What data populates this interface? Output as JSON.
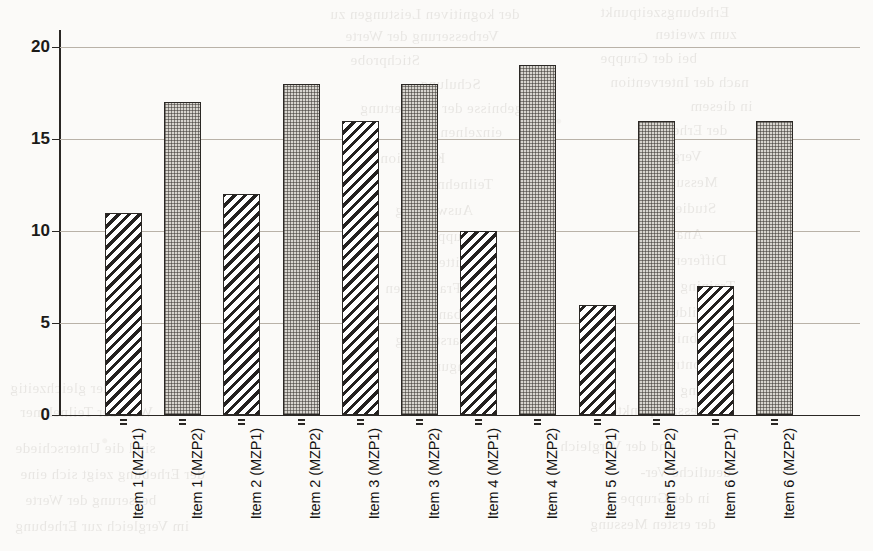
{
  "figure": {
    "kind": "scanned-bar-chart-figure",
    "page_background": "#fbfaf8",
    "ink_color": "#1c1a18",
    "gridline_color": "#b9b2a8"
  },
  "chart_data": {
    "type": "bar",
    "title": "",
    "subtitle": "",
    "xlabel": "",
    "ylabel": "",
    "categories": [
      "Item 1 (MZP1)",
      "Item 1 (MZP2)",
      "Item 2 (MZP1)",
      "Item 2 (MZP2)",
      "Item 3 (MZP1)",
      "Item 3 (MZP2)",
      "Item 4 (MZP1)",
      "Item 4 (MZP2)",
      "Item 5 (MZP1)",
      "Item 5 (MZP2)",
      "Item 6 (MZP1)",
      "Item 6 (MZP2)"
    ],
    "values": [
      11,
      17,
      12,
      18,
      16,
      18,
      10,
      19,
      6,
      16,
      7,
      16
    ],
    "fill_patterns": [
      "diagonal-hatch",
      "stipple",
      "diagonal-hatch",
      "stipple",
      "diagonal-hatch",
      "stipple",
      "diagonal-hatch",
      "stipple",
      "diagonal-hatch",
      "stipple",
      "diagonal-hatch",
      "stipple"
    ],
    "ylim": [
      0,
      20
    ],
    "ytick_values": [
      0,
      5,
      10,
      15,
      20
    ],
    "ytick_labels": [
      "0",
      "5",
      "10",
      "15",
      "20"
    ],
    "grid": true,
    "grid_axis": "y",
    "legend": null,
    "legend_position": "none",
    "annotations": [],
    "series_groups": [
      {
        "name": "MZP1",
        "pattern": "diagonal-hatch",
        "values": [
          11,
          12,
          16,
          10,
          6,
          7
        ]
      },
      {
        "name": "MZP2",
        "pattern": "stipple",
        "values": [
          17,
          18,
          18,
          19,
          16,
          16
        ]
      }
    ],
    "group_categories": [
      "Item 1",
      "Item 2",
      "Item 3",
      "Item 4",
      "Item 5",
      "Item 6"
    ]
  },
  "scan_bleed": {
    "note": "faint mirrored show-through text from reverse side of the scanned page",
    "lines": [
      {
        "text": "der kognitiven Leistungen zu",
        "x": 330,
        "y": 6,
        "size": 15
      },
      {
        "text": "Erhebungszeitpunkt",
        "x": 600,
        "y": 4,
        "size": 15
      },
      {
        "text": "Verbesserung der Werte",
        "x": 345,
        "y": 28,
        "size": 15
      },
      {
        "text": "zum zweiten",
        "x": 655,
        "y": 26,
        "size": 15
      },
      {
        "text": "Stichprobe",
        "x": 350,
        "y": 52,
        "size": 15
      },
      {
        "text": "bei der Gruppe",
        "x": 600,
        "y": 50,
        "size": 15
      },
      {
        "text": "Schulung",
        "x": 420,
        "y": 76,
        "size": 15
      },
      {
        "text": "nach der Intervention",
        "x": 610,
        "y": 74,
        "size": 15
      },
      {
        "text": "Ergebnisse der Auswertung",
        "x": 360,
        "y": 100,
        "size": 15
      },
      {
        "text": "in diesem",
        "x": 690,
        "y": 98,
        "size": 15
      },
      {
        "text": "einzelnen Items",
        "x": 400,
        "y": 124,
        "size": 15
      },
      {
        "text": "der Erhebung",
        "x": 640,
        "y": 122,
        "size": 15
      },
      {
        "text": "Kognition",
        "x": 380,
        "y": 150,
        "size": 15
      },
      {
        "text": "Vergleich",
        "x": 640,
        "y": 148,
        "size": 15
      },
      {
        "text": "Teilnehmer",
        "x": 420,
        "y": 176,
        "size": 15
      },
      {
        "text": "Messung",
        "x": 660,
        "y": 174,
        "size": 15
      },
      {
        "text": "Auswertung",
        "x": 395,
        "y": 202,
        "size": 15
      },
      {
        "text": "Studie",
        "x": 675,
        "y": 200,
        "size": 15
      },
      {
        "text": "Gruppe",
        "x": 430,
        "y": 228,
        "size": 15
      },
      {
        "text": "Analyse",
        "x": 650,
        "y": 226,
        "size": 15
      },
      {
        "text": "Mittelwert",
        "x": 405,
        "y": 254,
        "size": 15
      },
      {
        "text": "Differenz",
        "x": 665,
        "y": 252,
        "size": 15
      },
      {
        "text": "Fragebogen",
        "x": 385,
        "y": 280,
        "size": 15
      },
      {
        "text": "Training",
        "x": 680,
        "y": 278,
        "size": 15
      },
      {
        "text": "Probanden",
        "x": 415,
        "y": 306,
        "size": 15
      },
      {
        "text": "Abbildung",
        "x": 655,
        "y": 304,
        "size": 15
      },
      {
        "text": "Darstellung",
        "x": 395,
        "y": 332,
        "size": 15
      },
      {
        "text": "Ergebnis",
        "x": 670,
        "y": 330,
        "size": 15
      },
      {
        "text": "Befragung",
        "x": 425,
        "y": 358,
        "size": 15
      },
      {
        "text": "Kontrolle",
        "x": 650,
        "y": 356,
        "size": 15
      },
      {
        "text": "und der gleichzeitig",
        "x": 10,
        "y": 380,
        "size": 15
      },
      {
        "text": "Leistung",
        "x": 680,
        "y": 382,
        "size": 15
      },
      {
        "text": "Wert der Teilnehmer",
        "x": 20,
        "y": 404,
        "size": 15
      },
      {
        "text": "Messzeitpunkte",
        "x": 610,
        "y": 402,
        "size": 15
      },
      {
        "text": "sind die Unterschiede",
        "x": 15,
        "y": 440,
        "size": 15
      },
      {
        "text": "und der Vergleich",
        "x": 560,
        "y": 438,
        "size": 15
      },
      {
        "text": "der Erhebung zeigt sich eine",
        "x": 20,
        "y": 466,
        "size": 15
      },
      {
        "text": "deutliche Ver-",
        "x": 640,
        "y": 464,
        "size": 15
      },
      {
        "text": "besserung der Werte",
        "x": 25,
        "y": 492,
        "size": 15
      },
      {
        "text": "in der Gruppe",
        "x": 620,
        "y": 490,
        "size": 15
      },
      {
        "text": "im Vergleich zur Erhebung",
        "x": 15,
        "y": 518,
        "size": 15
      },
      {
        "text": "der ersten Messung",
        "x": 590,
        "y": 516,
        "size": 15
      }
    ]
  }
}
